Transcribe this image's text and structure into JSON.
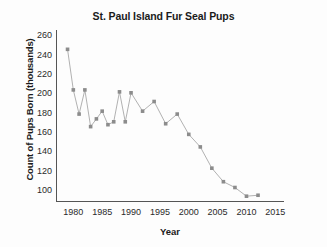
{
  "chart_data": {
    "type": "line",
    "title": "St. Paul Island Fur Seal Pups",
    "xlabel": "Year",
    "ylabel": "Count of Pups Born (thousands)",
    "xlim": [
      1977,
      2016.5
    ],
    "ylim": [
      88,
      266
    ],
    "xticks": [
      1980,
      1985,
      1990,
      1995,
      2000,
      2005,
      2010,
      2015
    ],
    "yticks": [
      100,
      120,
      140,
      160,
      180,
      200,
      220,
      240,
      260
    ],
    "grid": false,
    "legend": null,
    "marker": "square",
    "marker_color": "#8c8c8c",
    "line_color": "#a8a8a8",
    "x": [
      1979,
      1980,
      1981,
      1982,
      1983,
      1984,
      1985,
      1986,
      1987,
      1988,
      1989,
      1990,
      1992,
      1994,
      1996,
      1998,
      2000,
      2002,
      2004,
      2006,
      2008,
      2010,
      2012
    ],
    "values": [
      246,
      204,
      179,
      204,
      166,
      174,
      182,
      168,
      171,
      202,
      171,
      201,
      182,
      192,
      169,
      179,
      158,
      145,
      123,
      109,
      103,
      94,
      95
    ],
    "series": [
      {
        "name": "Count of Pups Born (thousands)",
        "values": [
          246,
          204,
          179,
          204,
          166,
          174,
          182,
          168,
          171,
          202,
          171,
          201,
          182,
          192,
          169,
          179,
          158,
          145,
          123,
          109,
          103,
          94,
          95
        ]
      }
    ]
  }
}
